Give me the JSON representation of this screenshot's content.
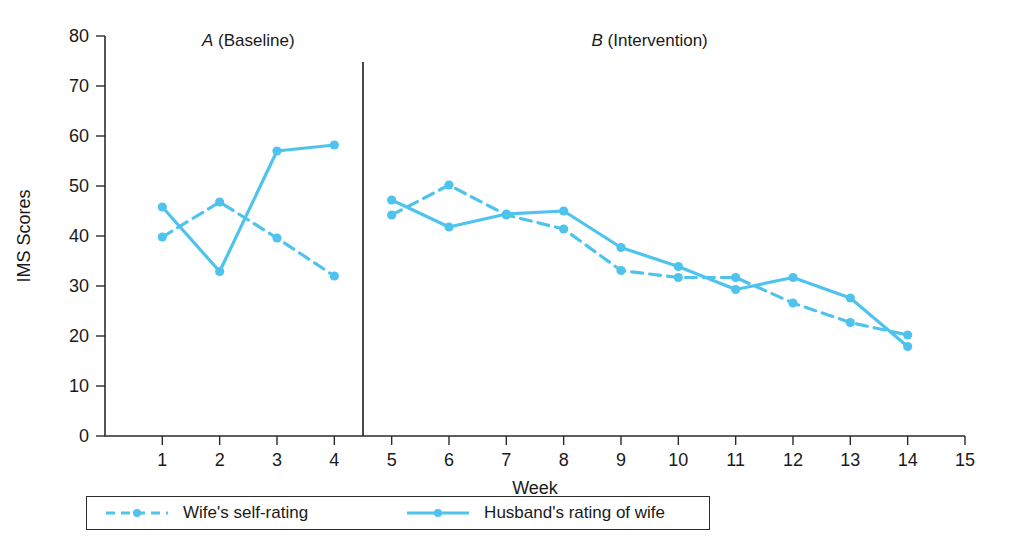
{
  "chart_data": {
    "type": "line",
    "title": "",
    "xlabel": "Week",
    "ylabel": "IMS Scores",
    "xlim": [
      0,
      15
    ],
    "ylim": [
      0,
      80
    ],
    "grid": false,
    "legend_position": "bottom",
    "x": [
      1,
      2,
      3,
      4,
      5,
      6,
      7,
      8,
      9,
      10,
      11,
      12,
      13,
      14
    ],
    "x_tick_labels": [
      "1",
      "2",
      "3",
      "4",
      "5",
      "6",
      "7",
      "8",
      "9",
      "10",
      "11",
      "12",
      "13",
      "14",
      "15"
    ],
    "y_tick_labels": [
      "0",
      "10",
      "20",
      "30",
      "40",
      "50",
      "60",
      "70",
      "80"
    ],
    "phases": [
      {
        "letter": "A",
        "name": "(Baseline)",
        "weeks": [
          1,
          2,
          3,
          4
        ]
      },
      {
        "letter": "B",
        "name": "(Intervention)",
        "weeks": [
          5,
          6,
          7,
          8,
          9,
          10,
          11,
          12,
          13,
          14
        ]
      }
    ],
    "phase_divider_x": 4.5,
    "series": [
      {
        "name": "Wife's self-rating",
        "style": "dashed",
        "color": "#4EC3ED",
        "values": [
          39.8,
          46.8,
          39.6,
          32.0,
          44.2,
          50.2,
          44.2,
          41.4,
          33.1,
          31.7,
          31.7,
          26.6,
          22.7,
          20.2
        ]
      },
      {
        "name": "Husband's rating of wife",
        "style": "solid",
        "color": "#4EC3ED",
        "values": [
          45.8,
          32.9,
          57.0,
          58.2,
          47.2,
          41.8,
          44.4,
          45.0,
          37.7,
          33.9,
          29.3,
          31.7,
          27.6,
          17.9
        ]
      }
    ]
  },
  "legend": {
    "items": [
      {
        "label": "Wife's self-rating",
        "style": "dashed"
      },
      {
        "label": "Husband's rating of wife",
        "style": "solid"
      }
    ]
  },
  "colors": {
    "series": "#4EC3ED",
    "axis": "#2b2b2b",
    "background": "#ffffff"
  }
}
